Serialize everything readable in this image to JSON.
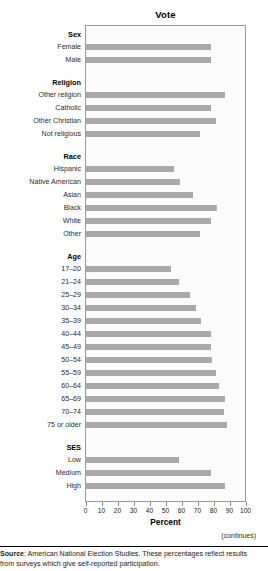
{
  "chart_data": {
    "type": "bar",
    "orientation": "horizontal",
    "title": "Vote",
    "xlabel": "Percent",
    "ylabel": "",
    "xlim": [
      0,
      100
    ],
    "grid": false,
    "legend": null,
    "tick_labels": [
      "0",
      "10",
      "20",
      "30",
      "40",
      "50",
      "60",
      "70",
      "80",
      "90",
      "100"
    ],
    "ticks": [
      0,
      10,
      20,
      30,
      40,
      50,
      60,
      70,
      80,
      90,
      100
    ],
    "bar_color": "#a9a9a9",
    "groups": [
      {
        "name": "Sex",
        "categories": [
          "Female",
          "Male"
        ],
        "values": [
          78,
          78
        ]
      },
      {
        "name": "Religion",
        "categories": [
          "Other religion",
          "Catholic",
          "Other Christian",
          "Not religious"
        ],
        "values": [
          87,
          78,
          81,
          71
        ]
      },
      {
        "name": "Race",
        "categories": [
          "Hispanic",
          "Native American",
          "Asian",
          "Black",
          "White",
          "Other"
        ],
        "values": [
          55,
          59,
          67,
          82,
          78,
          71
        ]
      },
      {
        "name": "Age",
        "categories": [
          "17–20",
          "21–24",
          "25–29",
          "30–34",
          "35–39",
          "40–44",
          "45–49",
          "50–54",
          "55–59",
          "60–64",
          "65–69",
          "70–74",
          "75 or older"
        ],
        "values": [
          53,
          58,
          65,
          69,
          72,
          78,
          78,
          79,
          81,
          83,
          87,
          86,
          88
        ]
      },
      {
        "name": "SES",
        "categories": [
          "Low",
          "Medium",
          "High"
        ],
        "values": [
          58,
          78,
          87
        ]
      }
    ]
  },
  "annotations": {
    "continues": "(continues)"
  },
  "footer": {
    "source_label": "Source",
    "source_text": ": American National Election Studies. These percentages reflect results from surveys which give self-reported participation."
  }
}
